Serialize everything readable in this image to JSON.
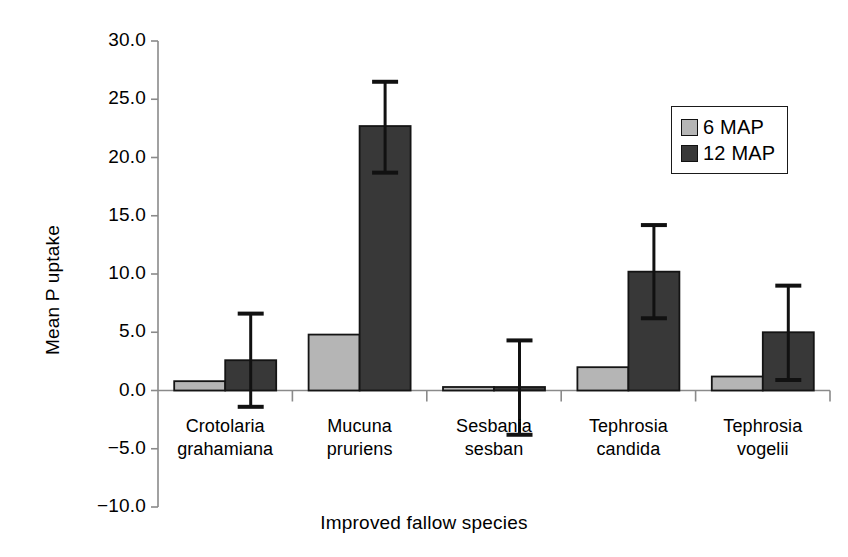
{
  "chart_data": {
    "type": "bar",
    "title": "",
    "xlabel": "Improved fallow species",
    "ylabel": "Mean P uptake",
    "categories": [
      "Crotolaria grahamiana",
      "Mucuna pruriens",
      "Sesbania sesban",
      "Tephrosia candida",
      "Tephrosia vogelii"
    ],
    "category_lines": [
      [
        "Crotolaria",
        "grahamiana"
      ],
      [
        "Mucuna",
        "pruriens"
      ],
      [
        "Sesbania",
        "sesban"
      ],
      [
        "Tephrosia",
        "candida"
      ],
      [
        "Tephrosia",
        "vogelii"
      ]
    ],
    "series": [
      {
        "name": "6 MAP",
        "color": "#b5b5b5",
        "values": [
          0.8,
          4.8,
          0.1,
          2.0,
          1.2
        ],
        "errors_low": [
          null,
          null,
          null,
          null,
          null
        ],
        "errors_high": [
          null,
          null,
          null,
          null,
          null
        ]
      },
      {
        "name": "12 MAP",
        "color": "#383838",
        "values": [
          2.6,
          22.7,
          0.3,
          10.2,
          5.0
        ],
        "errors_low": [
          -1.4,
          18.7,
          -3.8,
          6.2,
          0.9
        ],
        "errors_high": [
          6.6,
          26.5,
          4.3,
          14.2,
          9.0
        ]
      }
    ],
    "ylim": [
      -10.0,
      30.0
    ],
    "yticks": [
      30.0,
      25.0,
      20.0,
      15.0,
      10.0,
      5.0,
      0.0,
      -5.0,
      -10.0
    ],
    "ytick_labels": [
      "30.0",
      "25.0",
      "20.0",
      "15.0",
      "10.0",
      "5.0",
      "0.0",
      "−5.0",
      "−10.0"
    ],
    "grid": false,
    "legend_position": "top-right",
    "legend_entries": [
      "6 MAP",
      "12 MAP"
    ]
  },
  "legend": {
    "entry_0_label": "6 MAP",
    "entry_1_label": "12 MAP"
  },
  "axes": {
    "y_title": "Mean P uptake",
    "x_title": "Improved fallow species"
  }
}
